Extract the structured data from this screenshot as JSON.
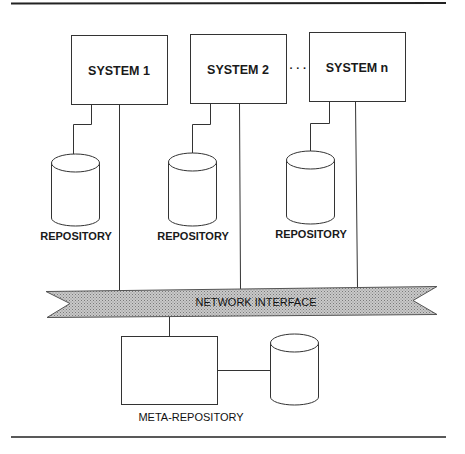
{
  "diagram": {
    "systems": [
      {
        "label": "SYSTEM 1",
        "repository_label": "REPOSITORY"
      },
      {
        "label": "SYSTEM 2",
        "repository_label": "REPOSITORY"
      },
      {
        "label": "SYSTEM n",
        "repository_label": "REPOSITORY"
      }
    ],
    "ellipsis": "· · ·",
    "network": {
      "label": "NETWORK INTERFACE"
    },
    "meta": {
      "label": "META-REPOSITORY"
    },
    "colors": {
      "line": "#333333",
      "banner_fill": "#b8b8b8",
      "background": "#ffffff"
    }
  }
}
